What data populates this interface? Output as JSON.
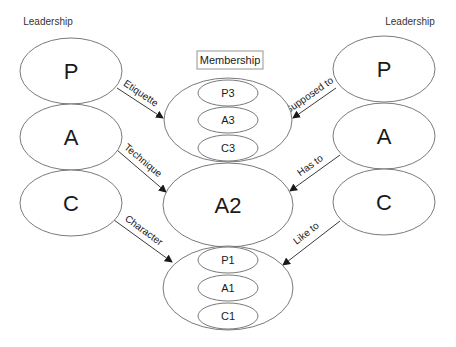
{
  "headers": {
    "left": "Leadership",
    "right": "Leadership",
    "center": "Membership"
  },
  "left_column": [
    {
      "label": "P"
    },
    {
      "label": "A"
    },
    {
      "label": "C"
    }
  ],
  "right_column": [
    {
      "label": "P"
    },
    {
      "label": "A"
    },
    {
      "label": "C"
    }
  ],
  "center": {
    "top_group": [
      "P3",
      "A3",
      "C3"
    ],
    "middle": "A2",
    "bottom_group": [
      "P1",
      "A1",
      "C1"
    ]
  },
  "arrows": {
    "left": [
      "Etiquette",
      "Technique",
      "Character"
    ],
    "right": [
      "Supposed to",
      "Has to",
      "Like to"
    ]
  },
  "colors": {
    "stroke": "#6b6b6b",
    "text": "#1a1a1a",
    "background": "#ffffff"
  }
}
